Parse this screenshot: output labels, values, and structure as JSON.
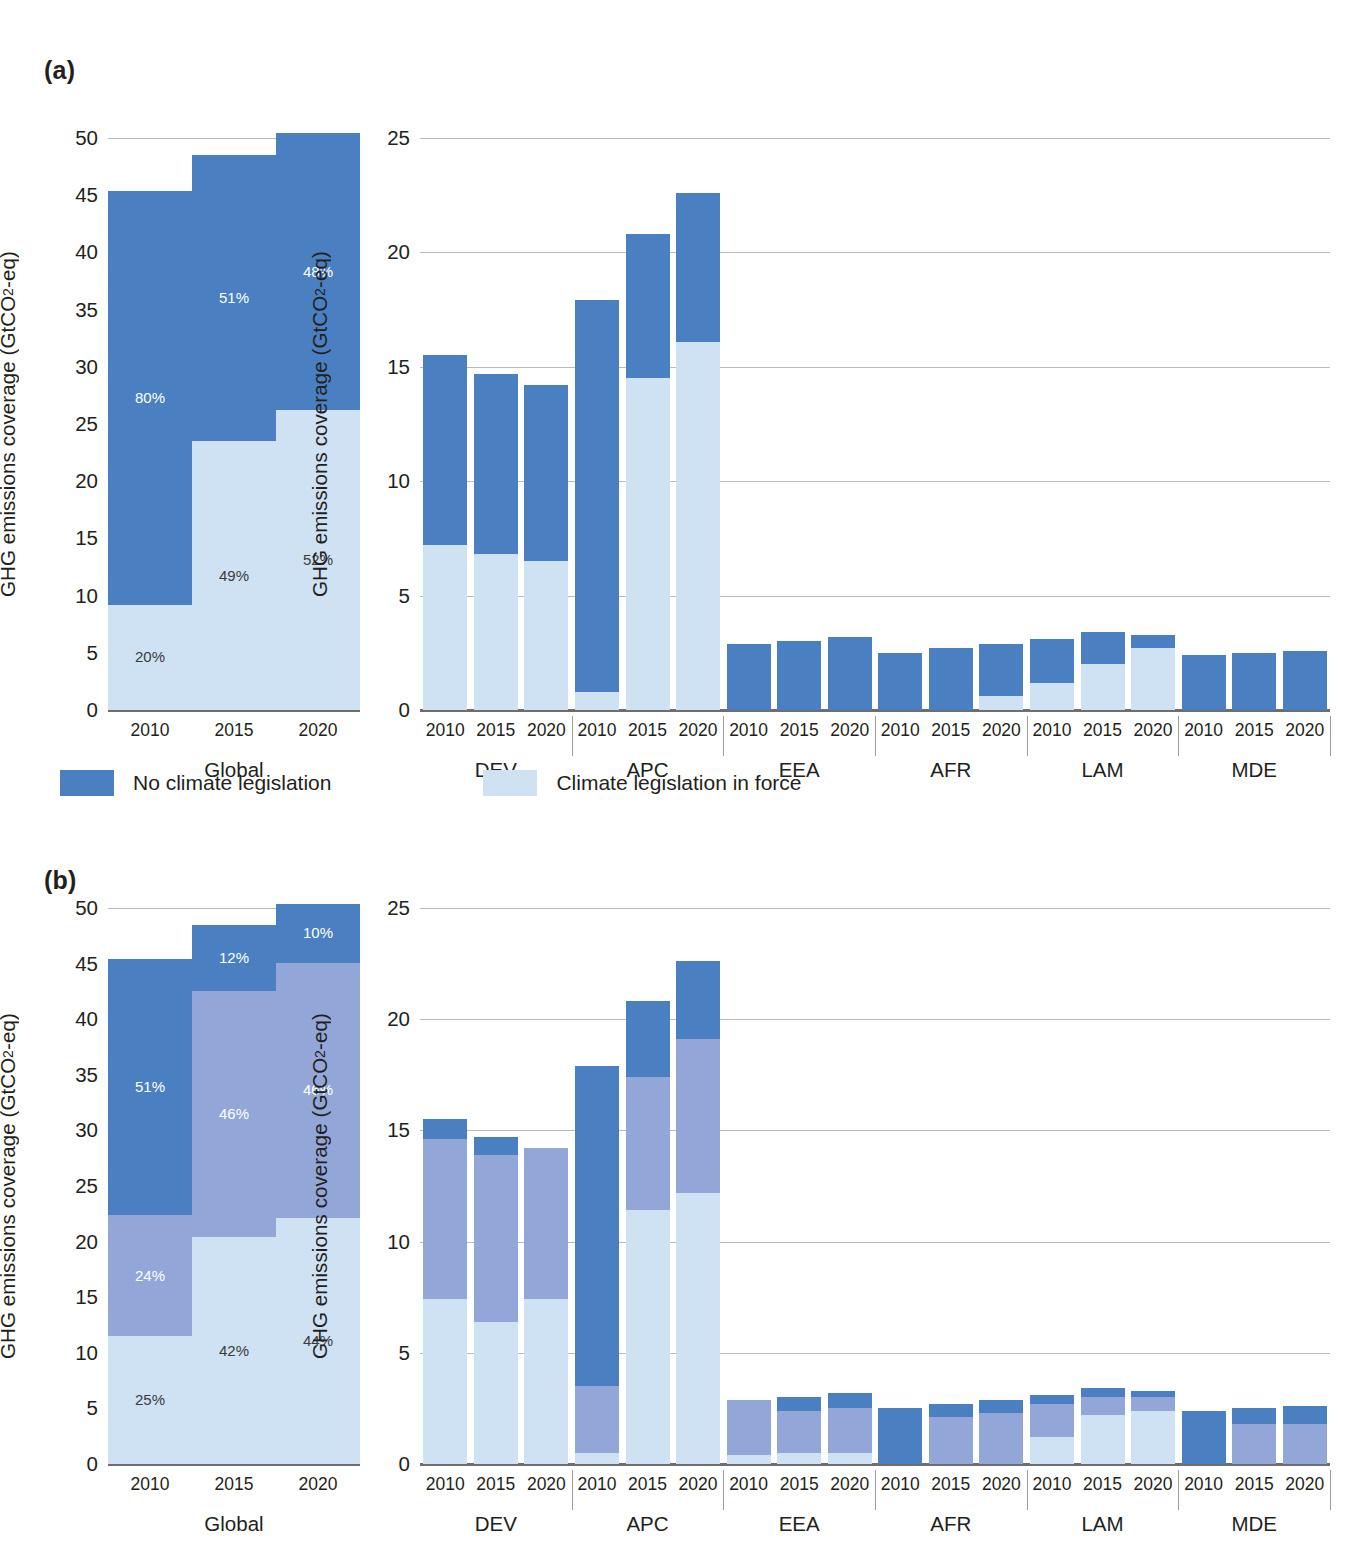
{
  "figure": {
    "panels": [
      {
        "tag": "(a)",
        "id": "panel-a"
      },
      {
        "tag": "(b)",
        "id": "panel-b"
      }
    ],
    "y_axis_label_prefix": "GHG emissions coverage (GtCO",
    "y_axis_label_sub": "2",
    "y_axis_label_suffix": "-eq)",
    "legend": [
      {
        "label": "No climate legislation",
        "color": "#4a7fc1"
      },
      {
        "label": "Climate legislation in force",
        "color": "#cfe2f3"
      }
    ],
    "colors": {
      "dark_blue": "#4a7fc1",
      "mid_blue": "#92a7d8",
      "light_blue": "#cfe2f3",
      "grid": "#b9bcbe",
      "axis": "#6d6e70",
      "text": "#231f20"
    }
  },
  "chart_data": [
    {
      "type": "bar",
      "id": "a-global",
      "panel": "(a)",
      "stacked": true,
      "title": "",
      "xlabel": "Global",
      "ylabel": "GHG emissions coverage (GtCO2-eq)",
      "ylim": [
        0,
        50
      ],
      "yticks": [
        0,
        5,
        10,
        15,
        20,
        25,
        30,
        35,
        40,
        45,
        50
      ],
      "grid": true,
      "categories": [
        "2010",
        "2015",
        "2020"
      ],
      "groups": [
        "Global"
      ],
      "series": [
        {
          "name": "Climate legislation in force",
          "color": "#cfe2f3",
          "values": [
            9.2,
            23.5,
            26.2
          ]
        },
        {
          "name": "No climate legislation",
          "color": "#4a7fc1",
          "values": [
            36.2,
            25.0,
            24.2
          ]
        }
      ],
      "totals": [
        45.4,
        48.5,
        50.4
      ],
      "data_labels": [
        {
          "category": "2010",
          "series": "Climate legislation in force",
          "text": "20%"
        },
        {
          "category": "2010",
          "series": "No climate legislation",
          "text": "80%"
        },
        {
          "category": "2015",
          "series": "Climate legislation in force",
          "text": "49%"
        },
        {
          "category": "2015",
          "series": "No climate legislation",
          "text": "51%"
        },
        {
          "category": "2020",
          "series": "Climate legislation in force",
          "text": "52%"
        },
        {
          "category": "2020",
          "series": "No climate legislation",
          "text": "48%"
        }
      ]
    },
    {
      "type": "bar",
      "id": "a-regions",
      "panel": "(a)",
      "stacked": true,
      "title": "",
      "xlabel": "",
      "ylabel": "GHG emissions coverage (GtCO2-eq)",
      "ylim": [
        0,
        25
      ],
      "yticks": [
        0,
        5,
        10,
        15,
        20,
        25
      ],
      "grid": true,
      "groups": [
        "DEV",
        "APC",
        "EEA",
        "AFR",
        "LAM",
        "MDE"
      ],
      "categories": [
        "2010",
        "2015",
        "2020"
      ],
      "bars": [
        {
          "group": "DEV",
          "year": "2010",
          "light": 7.2,
          "dark": 8.3,
          "total": 15.5
        },
        {
          "group": "DEV",
          "year": "2015",
          "light": 6.8,
          "dark": 7.9,
          "total": 14.7
        },
        {
          "group": "DEV",
          "year": "2020",
          "light": 6.5,
          "dark": 7.7,
          "total": 14.2
        },
        {
          "group": "APC",
          "year": "2010",
          "light": 0.8,
          "dark": 17.1,
          "total": 17.9
        },
        {
          "group": "APC",
          "year": "2015",
          "light": 14.5,
          "dark": 6.3,
          "total": 20.8
        },
        {
          "group": "APC",
          "year": "2020",
          "light": 16.1,
          "dark": 6.5,
          "total": 22.6
        },
        {
          "group": "EEA",
          "year": "2010",
          "light": 0.0,
          "dark": 2.9,
          "total": 2.9
        },
        {
          "group": "EEA",
          "year": "2015",
          "light": 0.0,
          "dark": 3.0,
          "total": 3.0
        },
        {
          "group": "EEA",
          "year": "2020",
          "light": 0.0,
          "dark": 3.2,
          "total": 3.2
        },
        {
          "group": "AFR",
          "year": "2010",
          "light": 0.0,
          "dark": 2.5,
          "total": 2.5
        },
        {
          "group": "AFR",
          "year": "2015",
          "light": 0.0,
          "dark": 2.7,
          "total": 2.7
        },
        {
          "group": "AFR",
          "year": "2020",
          "light": 0.6,
          "dark": 2.3,
          "total": 2.9
        },
        {
          "group": "LAM",
          "year": "2010",
          "light": 1.2,
          "dark": 1.9,
          "total": 3.1
        },
        {
          "group": "LAM",
          "year": "2015",
          "light": 2.0,
          "dark": 1.4,
          "total": 3.4
        },
        {
          "group": "LAM",
          "year": "2020",
          "light": 2.7,
          "dark": 0.6,
          "total": 3.3
        },
        {
          "group": "MDE",
          "year": "2010",
          "light": 0.0,
          "dark": 2.4,
          "total": 2.4
        },
        {
          "group": "MDE",
          "year": "2015",
          "light": 0.0,
          "dark": 2.5,
          "total": 2.5
        },
        {
          "group": "MDE",
          "year": "2020",
          "light": 0.0,
          "dark": 2.6,
          "total": 2.6
        }
      ]
    },
    {
      "type": "bar",
      "id": "b-global",
      "panel": "(b)",
      "stacked": true,
      "title": "",
      "xlabel": "Global",
      "ylabel": "GHG emissions coverage (GtCO2-eq)",
      "ylim": [
        0,
        50
      ],
      "yticks": [
        0,
        5,
        10,
        15,
        20,
        25,
        30,
        35,
        40,
        45,
        50
      ],
      "grid": true,
      "categories": [
        "2010",
        "2015",
        "2020"
      ],
      "groups": [
        "Global"
      ],
      "series": [
        {
          "name": "lower",
          "color": "#cfe2f3",
          "values": [
            11.5,
            20.4,
            22.1
          ]
        },
        {
          "name": "middle",
          "color": "#92a7d8",
          "values": [
            10.9,
            22.1,
            23.0
          ]
        },
        {
          "name": "upper",
          "color": "#4a7fc1",
          "values": [
            23.0,
            6.0,
            5.3
          ]
        }
      ],
      "totals": [
        45.4,
        48.5,
        50.4
      ],
      "data_labels": [
        {
          "category": "2010",
          "series": "lower",
          "text": "25%"
        },
        {
          "category": "2010",
          "series": "middle",
          "text": "24%"
        },
        {
          "category": "2010",
          "series": "upper",
          "text": "51%"
        },
        {
          "category": "2015",
          "series": "lower",
          "text": "42%"
        },
        {
          "category": "2015",
          "series": "middle",
          "text": "46%"
        },
        {
          "category": "2015",
          "series": "upper",
          "text": "12%"
        },
        {
          "category": "2020",
          "series": "lower",
          "text": "44%"
        },
        {
          "category": "2020",
          "series": "middle",
          "text": "46%"
        },
        {
          "category": "2020",
          "series": "upper",
          "text": "10%"
        }
      ]
    },
    {
      "type": "bar",
      "id": "b-regions",
      "panel": "(b)",
      "stacked": true,
      "title": "",
      "xlabel": "",
      "ylabel": "GHG emissions coverage (GtCO2-eq)",
      "ylim": [
        0,
        25
      ],
      "yticks": [
        0,
        5,
        10,
        15,
        20,
        25
      ],
      "grid": true,
      "groups": [
        "DEV",
        "APC",
        "EEA",
        "AFR",
        "LAM",
        "MDE"
      ],
      "categories": [
        "2010",
        "2015",
        "2020"
      ],
      "bars": [
        {
          "group": "DEV",
          "year": "2010",
          "light": 7.4,
          "mid": 7.2,
          "dark": 0.9,
          "total": 15.5
        },
        {
          "group": "DEV",
          "year": "2015",
          "light": 6.4,
          "mid": 7.5,
          "dark": 0.8,
          "total": 14.7
        },
        {
          "group": "DEV",
          "year": "2020",
          "light": 7.4,
          "mid": 6.8,
          "dark": 0.0,
          "total": 14.2
        },
        {
          "group": "APC",
          "year": "2010",
          "light": 0.5,
          "mid": 3.0,
          "dark": 14.4,
          "total": 17.9
        },
        {
          "group": "APC",
          "year": "2015",
          "light": 11.4,
          "mid": 6.0,
          "dark": 3.4,
          "total": 20.8
        },
        {
          "group": "APC",
          "year": "2020",
          "light": 12.2,
          "mid": 6.9,
          "dark": 3.5,
          "total": 22.6
        },
        {
          "group": "EEA",
          "year": "2010",
          "light": 0.4,
          "mid": 2.5,
          "dark": 0.0,
          "total": 2.9
        },
        {
          "group": "EEA",
          "year": "2015",
          "light": 0.5,
          "mid": 1.9,
          "dark": 0.6,
          "total": 3.0
        },
        {
          "group": "EEA",
          "year": "2020",
          "light": 0.5,
          "mid": 2.0,
          "dark": 0.7,
          "total": 3.2
        },
        {
          "group": "AFR",
          "year": "2010",
          "light": 0.0,
          "mid": 0.0,
          "dark": 2.5,
          "total": 2.5
        },
        {
          "group": "AFR",
          "year": "2015",
          "light": 0.0,
          "mid": 2.1,
          "dark": 0.6,
          "total": 2.7
        },
        {
          "group": "AFR",
          "year": "2020",
          "light": 0.0,
          "mid": 2.3,
          "dark": 0.6,
          "total": 2.9
        },
        {
          "group": "LAM",
          "year": "2010",
          "light": 1.2,
          "mid": 1.5,
          "dark": 0.4,
          "total": 3.1
        },
        {
          "group": "LAM",
          "year": "2015",
          "light": 2.2,
          "mid": 0.8,
          "dark": 0.4,
          "total": 3.4
        },
        {
          "group": "LAM",
          "year": "2020",
          "light": 2.4,
          "mid": 0.6,
          "dark": 0.3,
          "total": 3.3
        },
        {
          "group": "MDE",
          "year": "2010",
          "light": 0.0,
          "mid": 0.0,
          "dark": 2.4,
          "total": 2.4
        },
        {
          "group": "MDE",
          "year": "2015",
          "light": 0.0,
          "mid": 1.8,
          "dark": 0.7,
          "total": 2.5
        },
        {
          "group": "MDE",
          "year": "2020",
          "light": 0.0,
          "mid": 1.8,
          "dark": 0.8,
          "total": 2.6
        }
      ]
    }
  ]
}
